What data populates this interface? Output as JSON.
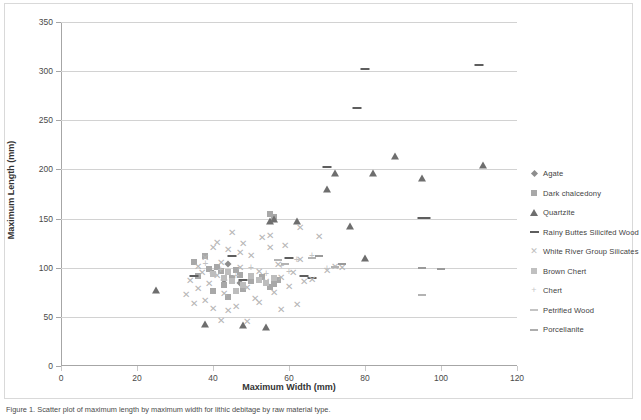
{
  "figure": {
    "caption": "Figure 1. Scatter plot of maximum length by maximum width for lithic debitage by raw material type."
  },
  "chart_data": {
    "type": "scatter",
    "title": "",
    "xlabel": "Maximum Width (mm)",
    "ylabel": "Maximum Length (mm)",
    "xlim": [
      0,
      120
    ],
    "ylim": [
      0,
      350
    ],
    "xticks": [
      0,
      20,
      40,
      60,
      80,
      100,
      120
    ],
    "yticks": [
      0,
      50,
      100,
      150,
      200,
      250,
      300,
      350
    ],
    "grid": "horizontal",
    "legend_position": "right",
    "series": [
      {
        "name": "Agate",
        "marker": "diamond",
        "color": "#8d8d8d",
        "points": [
          [
            40,
            95
          ],
          [
            43,
            88
          ],
          [
            47,
            84
          ],
          [
            44,
            104
          ]
        ]
      },
      {
        "name": "Dark chalcedony",
        "marker": "square",
        "color": "#a8a8a8",
        "points": [
          [
            35,
            106
          ],
          [
            38,
            112
          ],
          [
            41,
            101
          ],
          [
            36,
            92
          ],
          [
            42,
            97
          ],
          [
            45,
            90
          ],
          [
            43,
            82
          ],
          [
            47,
            93
          ],
          [
            50,
            86
          ],
          [
            52,
            88
          ],
          [
            54,
            84
          ],
          [
            55,
            80
          ],
          [
            56,
            83
          ],
          [
            40,
            76
          ],
          [
            44,
            70
          ],
          [
            48,
            78
          ],
          [
            39,
            99
          ],
          [
            46,
            98
          ],
          [
            53,
            91
          ],
          [
            57,
            87
          ],
          [
            55,
            155
          ],
          [
            56,
            152
          ]
        ]
      },
      {
        "name": "Quartzite",
        "marker": "triangle",
        "color": "#6e6e6e",
        "points": [
          [
            25,
            77
          ],
          [
            38,
            43
          ],
          [
            48,
            42
          ],
          [
            55,
            148
          ],
          [
            56,
            150
          ],
          [
            62,
            148
          ],
          [
            70,
            180
          ],
          [
            72,
            196
          ],
          [
            76,
            142
          ],
          [
            80,
            110
          ],
          [
            88,
            214
          ],
          [
            95,
            191
          ],
          [
            111,
            205
          ],
          [
            54,
            40
          ],
          [
            82,
            196
          ]
        ]
      },
      {
        "name": "Rainy Buttes Silicifed Wood",
        "marker": "dash",
        "color": "#5e5e5e",
        "points": [
          [
            35,
            92
          ],
          [
            45,
            112
          ],
          [
            48,
            88
          ],
          [
            60,
            110
          ],
          [
            64,
            92
          ],
          [
            66,
            90
          ],
          [
            70,
            202
          ],
          [
            78,
            262
          ],
          [
            80,
            302
          ],
          [
            95,
            151
          ],
          [
            96,
            151
          ],
          [
            110,
            306
          ]
        ]
      },
      {
        "name": "White River Group Silicates",
        "marker": "x",
        "color": "#b5b5b5",
        "points": [
          [
            33,
            72
          ],
          [
            34,
            86
          ],
          [
            35,
            63
          ],
          [
            36,
            78
          ],
          [
            37,
            95
          ],
          [
            38,
            110
          ],
          [
            38,
            66
          ],
          [
            39,
            83
          ],
          [
            40,
            120
          ],
          [
            40,
            58
          ],
          [
            41,
            92
          ],
          [
            42,
            105
          ],
          [
            43,
            73
          ],
          [
            44,
            118
          ],
          [
            45,
            86
          ],
          [
            46,
            60
          ],
          [
            47,
            100
          ],
          [
            48,
            124
          ],
          [
            49,
            79
          ],
          [
            50,
            112
          ],
          [
            51,
            68
          ],
          [
            52,
            96
          ],
          [
            53,
            130
          ],
          [
            54,
            85
          ],
          [
            55,
            120
          ],
          [
            56,
            74
          ],
          [
            57,
            103
          ],
          [
            58,
            90
          ],
          [
            59,
            122
          ],
          [
            60,
            80
          ],
          [
            61,
            95
          ],
          [
            62,
            62
          ],
          [
            63,
            108
          ],
          [
            64,
            85
          ],
          [
            58,
            57
          ],
          [
            44,
            56
          ],
          [
            55,
            132
          ],
          [
            68,
            131
          ],
          [
            70,
            97
          ],
          [
            72,
            101
          ],
          [
            42,
            46
          ],
          [
            49,
            45
          ],
          [
            36,
            101
          ],
          [
            47,
            115
          ],
          [
            52,
            64
          ],
          [
            66,
            88
          ],
          [
            41,
            125
          ],
          [
            45,
            135
          ],
          [
            63,
            140
          ],
          [
            74,
            100
          ]
        ]
      },
      {
        "name": "Brown Chert",
        "marker": "square-light",
        "color": "#bdbdbd",
        "points": [
          [
            40,
            94
          ],
          [
            43,
            90
          ],
          [
            45,
            86
          ],
          [
            48,
            82
          ],
          [
            50,
            92
          ],
          [
            52,
            88
          ],
          [
            54,
            84
          ],
          [
            56,
            90
          ],
          [
            46,
            76
          ],
          [
            44,
            96
          ]
        ]
      },
      {
        "name": "Chert",
        "marker": "plus",
        "color": "#c2c2c2",
        "points": [
          [
            38,
            104
          ],
          [
            42,
            98
          ],
          [
            46,
            92
          ],
          [
            50,
            100
          ],
          [
            54,
            94
          ],
          [
            58,
            102
          ],
          [
            62,
            108
          ],
          [
            66,
            112
          ],
          [
            70,
            99
          ],
          [
            60,
            96
          ]
        ]
      },
      {
        "name": "Petrified Wood",
        "marker": "dash-light",
        "color": "#b3b3b3",
        "points": [
          [
            57,
            108
          ],
          [
            59,
            104
          ],
          [
            66,
            110
          ],
          [
            72,
            101
          ],
          [
            95,
            72
          ]
        ]
      },
      {
        "name": "Porcellanite",
        "marker": "dash-mid",
        "color": "#9a9a9a",
        "points": [
          [
            68,
            112
          ],
          [
            74,
            104
          ],
          [
            95,
            100
          ],
          [
            100,
            99
          ]
        ]
      }
    ]
  },
  "axes": {
    "y_tick_labels": [
      "0",
      "50",
      "100",
      "150",
      "200",
      "250",
      "300",
      "350"
    ],
    "x_tick_labels": [
      "0",
      "20",
      "40",
      "60",
      "80",
      "100",
      "120"
    ]
  }
}
